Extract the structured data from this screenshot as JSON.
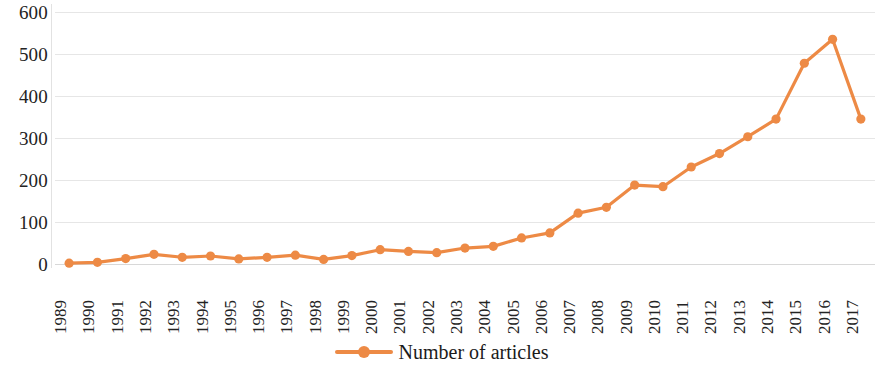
{
  "chart_data": {
    "type": "line",
    "title": "",
    "xlabel": "",
    "ylabel": "",
    "categories": [
      "1989",
      "1990",
      "1991",
      "1992",
      "1993",
      "1994",
      "1995",
      "1996",
      "1997",
      "1998",
      "1999",
      "2000",
      "2001",
      "2002",
      "2003",
      "2004",
      "2005",
      "2006",
      "2007",
      "2008",
      "2009",
      "2010",
      "2011",
      "2012",
      "2013",
      "2014",
      "2015",
      "2016",
      "2017"
    ],
    "series": [
      {
        "name": "Number of articles",
        "color": "#ED8A45",
        "values": [
          2,
          4,
          13,
          23,
          16,
          19,
          12,
          16,
          21,
          11,
          20,
          34,
          30,
          27,
          38,
          42,
          62,
          74,
          121,
          135,
          188,
          184,
          231,
          263,
          303,
          345,
          478,
          535,
          345
        ]
      }
    ],
    "ylim": [
      0,
      600
    ],
    "yticks": [
      0,
      100,
      200,
      300,
      400,
      500,
      600
    ],
    "ytick_labels": [
      "0",
      "100",
      "200",
      "300",
      "400",
      "500",
      "600"
    ],
    "grid": true,
    "legend_position": "bottom",
    "legend": [
      "Number of articles"
    ],
    "marker": "circle",
    "background_color": "#ffffff",
    "gridline_color": "#e6e6e6"
  }
}
